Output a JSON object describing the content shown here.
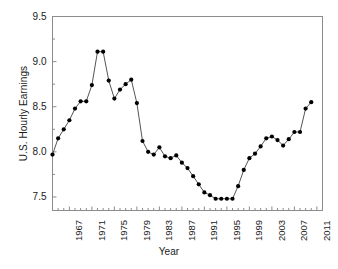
{
  "chart_data": {
    "type": "line",
    "title": "",
    "xlabel": "Year",
    "ylabel": "U.S. Hourly Earnings",
    "xlim": [
      1964,
      2012
    ],
    "ylim": [
      7.35,
      9.5
    ],
    "grid": false,
    "legend": "none",
    "marker": "filled-circle",
    "line_color": "#555555",
    "marker_color": "#000000",
    "frame_color": "#808080",
    "y_ticks": [
      "9.5",
      "9.0",
      "8.5",
      "8.0",
      "7.5"
    ],
    "y_tick_values": [
      9.5,
      9.0,
      8.5,
      8.0,
      7.5
    ],
    "x_ticks": [
      "1967",
      "1971",
      "1975",
      "1979",
      "1983",
      "1987",
      "1991",
      "1995",
      "1999",
      "2003",
      "2007",
      "2011"
    ],
    "x_tick_values": [
      1967,
      1971,
      1975,
      1979,
      1983,
      1987,
      1991,
      1995,
      1999,
      2003,
      2007,
      2011
    ],
    "x": [
      1964,
      1965,
      1966,
      1967,
      1968,
      1969,
      1970,
      1971,
      1972,
      1973,
      1974,
      1975,
      1976,
      1977,
      1978,
      1979,
      1980,
      1981,
      1982,
      1983,
      1984,
      1985,
      1986,
      1987,
      1988,
      1989,
      1990,
      1991,
      1992,
      1993,
      1994,
      1995,
      1996,
      1997,
      1998,
      1999,
      2000,
      2001,
      2002,
      2003,
      2004,
      2005,
      2006,
      2007,
      2008,
      2009,
      2010
    ],
    "values": [
      7.97,
      8.15,
      8.25,
      8.35,
      8.48,
      8.56,
      8.56,
      8.74,
      9.11,
      9.11,
      8.79,
      8.59,
      8.69,
      8.75,
      8.8,
      8.54,
      8.12,
      8.0,
      7.97,
      8.05,
      7.95,
      7.93,
      7.96,
      7.88,
      7.82,
      7.73,
      7.64,
      7.55,
      7.52,
      7.48,
      7.48,
      7.48,
      7.48,
      7.62,
      7.8,
      7.93,
      7.98,
      8.06,
      8.15,
      8.17,
      8.13,
      8.07,
      8.14,
      8.22,
      8.22,
      8.48,
      8.55
    ]
  }
}
